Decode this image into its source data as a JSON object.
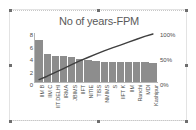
{
  "chart_object": {
    "selected": true,
    "handles": [
      "top-left",
      "top-center",
      "top-right",
      "middle-left",
      "middle-right",
      "bottom-left",
      "bottom-center",
      "bottom-right"
    ]
  },
  "chart_data": {
    "type": "bar",
    "title": "No of years-FPM",
    "xlabel": "",
    "ylabel": "",
    "grid": false,
    "legend": "none",
    "categories": [
      "IIM B",
      "IIM C",
      "IIT DELHI",
      "IRMA",
      "JBIMS",
      "IIFT",
      "NITIE",
      "TISS",
      "NMIMS",
      "S",
      "IIFT K",
      "IIM",
      "Ranchi",
      "MDI",
      "Kashipur"
    ],
    "series": [
      {
        "name": "No of years-FPM",
        "type": "bar",
        "axis": "left",
        "values": [
          7,
          4.6,
          4.4,
          4.3,
          4.2,
          3.8,
          3.6,
          3.5,
          3.4,
          3.4,
          3.4,
          3.4,
          3.4,
          3.3,
          3.2
        ]
      },
      {
        "name": "Cumulative %",
        "type": "line",
        "axis": "right",
        "values": [
          5,
          12,
          20,
          28,
          36,
          44,
          51,
          58,
          65,
          71,
          77,
          83,
          89,
          95,
          100
        ]
      }
    ],
    "ylim": [
      0,
      8
    ],
    "y_ticks": [
      "0",
      "2",
      "4",
      "6",
      "8"
    ],
    "y2lim": [
      0,
      100
    ],
    "y2_ticks": [
      "0%",
      "50%",
      "100%"
    ],
    "colors": {
      "bar": "#8d8d8d",
      "line": "#3f3f3f",
      "title_text": "#5a5a5a",
      "axis_text": "#4d4d4d",
      "plot_background": "#ffffff"
    }
  }
}
